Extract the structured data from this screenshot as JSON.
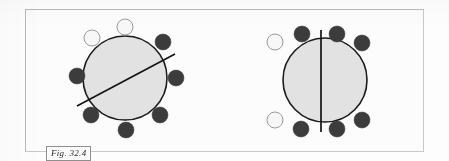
{
  "figure": {
    "caption": "Fig. 32.4",
    "colors": {
      "page_background": "#fdfdfd",
      "frame_border": "#b9b9b9",
      "main_circle_fill": "#e2e2e2",
      "main_circle_stroke": "#1c1c1c",
      "dark_node_fill": "#3c3c3c",
      "light_node_fill": "#f7f7f7",
      "light_node_stroke": "#9a9a9a",
      "division_line": "#141414"
    },
    "diagrams": [
      {
        "id": "left",
        "name": "circle-with-oblique-division-line",
        "main_circle": {
          "cx": 85,
          "cy": 68,
          "r": 42
        },
        "division_line": {
          "type": "oblique",
          "x1": 37,
          "y1": 96,
          "x2": 135,
          "y2": 44
        },
        "nodes": [
          {
            "index": 1,
            "shade": "light",
            "cx": 85,
            "cy": 17,
            "r": 8
          },
          {
            "index": 2,
            "shade": "light",
            "cx": 52,
            "cy": 28,
            "r": 8
          },
          {
            "index": 3,
            "shade": "dark",
            "cx": 123,
            "cy": 32,
            "r": 8
          },
          {
            "index": 4,
            "shade": "dark",
            "cx": 37,
            "cy": 66,
            "r": 8
          },
          {
            "index": 5,
            "shade": "dark",
            "cx": 136,
            "cy": 68,
            "r": 8
          },
          {
            "index": 6,
            "shade": "dark",
            "cx": 51,
            "cy": 105,
            "r": 8
          },
          {
            "index": 7,
            "shade": "dark",
            "cx": 120,
            "cy": 105,
            "r": 8
          },
          {
            "index": 8,
            "shade": "dark",
            "cx": 86,
            "cy": 120,
            "r": 8
          }
        ]
      },
      {
        "id": "right",
        "name": "circle-with-vertical-division-line",
        "main_circle": {
          "cx": 85,
          "cy": 70,
          "r": 42
        },
        "division_line": {
          "type": "vertical",
          "x1": 81,
          "y1": 20,
          "x2": 81,
          "y2": 122
        },
        "nodes": [
          {
            "index": 1,
            "shade": "dark",
            "cx": 62,
            "cy": 24,
            "r": 8
          },
          {
            "index": 2,
            "shade": "dark",
            "cx": 97,
            "cy": 24,
            "r": 8
          },
          {
            "index": 3,
            "shade": "dark",
            "cx": 122,
            "cy": 33,
            "r": 8
          },
          {
            "index": 4,
            "shade": "light",
            "cx": 35,
            "cy": 32,
            "r": 8
          },
          {
            "index": 5,
            "shade": "light",
            "cx": 35,
            "cy": 110,
            "r": 8
          },
          {
            "index": 6,
            "shade": "dark",
            "cx": 61,
            "cy": 119,
            "r": 8
          },
          {
            "index": 7,
            "shade": "dark",
            "cx": 97,
            "cy": 119,
            "r": 8
          },
          {
            "index": 8,
            "shade": "dark",
            "cx": 122,
            "cy": 110,
            "r": 8
          }
        ]
      }
    ]
  }
}
